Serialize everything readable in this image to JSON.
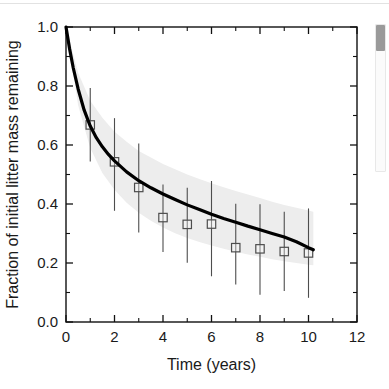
{
  "chart_data": {
    "type": "line",
    "title": "",
    "xlabel": "Time (years)",
    "ylabel": "Fraction of initial litter mass remaining",
    "xlim": [
      0,
      12
    ],
    "ylim": [
      0.0,
      1.0
    ],
    "grid": false,
    "legend": "none",
    "x_ticks": [
      0,
      2,
      4,
      6,
      8,
      10,
      12
    ],
    "x_tick_labels": [
      "0",
      "2",
      "4",
      "6",
      "8",
      "10",
      "12"
    ],
    "x_minor_ticks": [
      1,
      3,
      5,
      7,
      9,
      11
    ],
    "y_ticks": [
      0.0,
      0.2,
      0.4,
      0.6,
      0.8,
      1.0
    ],
    "y_tick_labels": [
      "0.0",
      "0.2",
      "0.4",
      "0.6",
      "0.8",
      "1.0"
    ],
    "y_minor_ticks": [
      0.1,
      0.3,
      0.5,
      0.7,
      0.9
    ],
    "series": [
      {
        "name": "fitted decay curve",
        "type": "line",
        "color": "#000000",
        "linewidth": 3.2,
        "x": [
          0.0,
          0.15,
          0.3,
          0.5,
          0.75,
          1.0,
          1.25,
          1.5,
          1.75,
          2.0,
          2.5,
          3.0,
          3.5,
          4.0,
          4.5,
          5.0,
          5.5,
          6.0,
          6.5,
          7.0,
          7.5,
          8.0,
          8.5,
          9.0,
          9.5,
          10.0,
          10.2
        ],
        "y": [
          1.0,
          0.925,
          0.861,
          0.79,
          0.718,
          0.664,
          0.625,
          0.594,
          0.568,
          0.546,
          0.509,
          0.479,
          0.455,
          0.434,
          0.415,
          0.397,
          0.381,
          0.365,
          0.351,
          0.338,
          0.325,
          0.313,
          0.3,
          0.288,
          0.272,
          0.252,
          0.245
        ]
      },
      {
        "name": "confidence band upper",
        "type": "band-upper",
        "color": "#ededed",
        "x": [
          0.0,
          0.5,
          1.0,
          1.5,
          2.0,
          2.5,
          3.0,
          3.5,
          4.0,
          4.5,
          5.0,
          5.5,
          6.0,
          6.5,
          7.0,
          7.5,
          8.0,
          8.5,
          9.0,
          9.5,
          10.0,
          10.2
        ],
        "y": [
          1.0,
          0.845,
          0.75,
          0.692,
          0.645,
          0.611,
          0.58,
          0.558,
          0.536,
          0.518,
          0.5,
          0.485,
          0.47,
          0.457,
          0.444,
          0.432,
          0.42,
          0.408,
          0.397,
          0.387,
          0.378,
          0.374
        ]
      },
      {
        "name": "confidence band lower",
        "type": "band-lower",
        "color": "#ededed",
        "x": [
          0.0,
          0.5,
          1.0,
          1.5,
          2.0,
          2.5,
          3.0,
          3.5,
          4.0,
          4.5,
          5.0,
          5.5,
          6.0,
          6.5,
          7.0,
          7.5,
          8.0,
          8.5,
          9.0,
          9.5,
          10.0,
          10.2
        ],
        "y": [
          1.0,
          0.735,
          0.59,
          0.505,
          0.448,
          0.404,
          0.37,
          0.343,
          0.32,
          0.301,
          0.285,
          0.271,
          0.259,
          0.248,
          0.238,
          0.229,
          0.221,
          0.213,
          0.206,
          0.2,
          0.194,
          0.192
        ]
      },
      {
        "name": "observed mean litter mass remaining",
        "type": "scatter",
        "marker": "open-square",
        "color": "#4d4d4d",
        "x": [
          1,
          2,
          3,
          4,
          5,
          6,
          7,
          8,
          9,
          10
        ],
        "y": [
          0.668,
          0.543,
          0.456,
          0.354,
          0.331,
          0.332,
          0.252,
          0.248,
          0.239,
          0.234
        ],
        "error_upper": [
          0.793,
          0.691,
          0.605,
          0.466,
          0.455,
          0.478,
          0.401,
          0.399,
          0.374,
          0.385
        ],
        "error_lower": [
          0.544,
          0.377,
          0.303,
          0.237,
          0.201,
          0.155,
          0.127,
          0.092,
          0.105,
          0.082
        ]
      }
    ]
  },
  "scrollbar": {
    "name": "vertical-scrollbar",
    "thumb_position_percent": 0
  }
}
